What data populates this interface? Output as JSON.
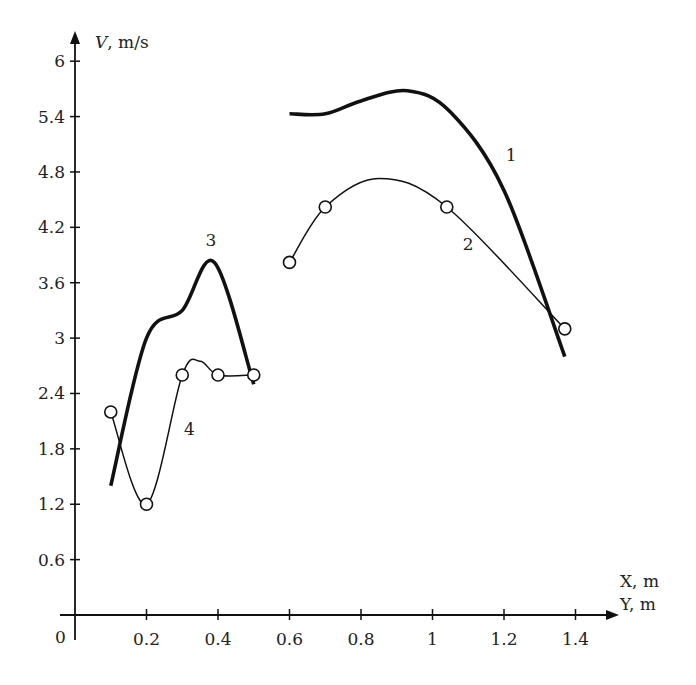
{
  "chart_data": {
    "type": "line",
    "title": "",
    "xlabel": "X, m",
    "xlabel2": "Y, m",
    "ylabel_var": "V",
    "ylabel_unit": ", m/s",
    "origin_label": "0",
    "xlim": [
      0,
      1.5
    ],
    "ylim": [
      0,
      6.4
    ],
    "xticks": [
      0.2,
      0.4,
      0.6,
      0.8,
      1,
      1.2,
      1.4
    ],
    "xtick_labels": [
      "0.2",
      "0.4",
      "0.6",
      "0.8",
      "1",
      "1.2",
      "1.4"
    ],
    "yticks": [
      0.6,
      1.2,
      1.8,
      2.4,
      3,
      3.6,
      4.2,
      4.8,
      5.4,
      6
    ],
    "ytick_labels": [
      "0.6",
      "1.2",
      "1.8",
      "2.4",
      "3",
      "3.6",
      "4.2",
      "4.8",
      "5.4",
      "6"
    ],
    "grid": false,
    "legend": "none",
    "series": [
      {
        "name": "1",
        "style": "thick",
        "markers": false,
        "x": [
          0.6,
          0.7,
          0.8,
          0.93,
          1.05,
          1.2,
          1.37
        ],
        "y": [
          5.43,
          5.43,
          5.57,
          5.68,
          5.45,
          4.6,
          2.8
        ],
        "label_at": [
          1.22,
          4.92
        ]
      },
      {
        "name": "2",
        "style": "thin",
        "markers": true,
        "x": [
          0.6,
          0.7,
          0.85,
          1.04,
          1.37
        ],
        "y": [
          3.82,
          4.42,
          4.73,
          4.42,
          3.1
        ],
        "marker_x": [
          0.6,
          0.7,
          1.04,
          1.37
        ],
        "marker_y": [
          3.82,
          4.42,
          4.42,
          3.1
        ],
        "label_at": [
          1.1,
          3.95
        ]
      },
      {
        "name": "3",
        "style": "thick",
        "markers": false,
        "x": [
          0.1,
          0.2,
          0.3,
          0.39,
          0.5
        ],
        "y": [
          1.4,
          3.0,
          3.3,
          3.82,
          2.5
        ],
        "label_at": [
          0.38,
          4.0
        ]
      },
      {
        "name": "4",
        "style": "thin",
        "markers": true,
        "x": [
          0.1,
          0.2,
          0.3,
          0.35,
          0.4,
          0.5
        ],
        "y": [
          2.2,
          1.2,
          2.6,
          2.75,
          2.6,
          2.6
        ],
        "marker_x": [
          0.1,
          0.2,
          0.3,
          0.4,
          0.5
        ],
        "marker_y": [
          2.2,
          1.2,
          2.6,
          2.6,
          2.6
        ],
        "label_at": [
          0.32,
          1.95
        ]
      }
    ]
  }
}
